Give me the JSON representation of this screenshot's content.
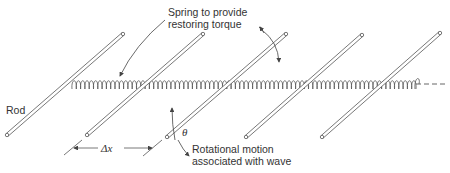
{
  "diagram": {
    "labels": {
      "spring_line1": "Spring to provide",
      "spring_line2": "restoring torque",
      "rod": "Rod",
      "delta_x": "Δx",
      "theta": "θ",
      "rotation_line1": "Rotational motion",
      "rotation_line2": "associated with wave"
    },
    "colors": {
      "stroke": "#555555",
      "background": "#ffffff"
    },
    "rods": [
      {
        "x1": 7,
        "y1": 135,
        "x2": 123,
        "y2": 34
      },
      {
        "x1": 87,
        "y1": 135,
        "x2": 203,
        "y2": 34
      },
      {
        "x1": 167,
        "y1": 137,
        "x2": 286,
        "y2": 34
      },
      {
        "x1": 246,
        "y1": 137,
        "x2": 362,
        "y2": 35
      },
      {
        "x1": 322,
        "y1": 137,
        "x2": 440,
        "y2": 33
      }
    ],
    "spring": {
      "x_start": 72,
      "x_end": 415,
      "y": 84,
      "dash_end": 447
    }
  }
}
